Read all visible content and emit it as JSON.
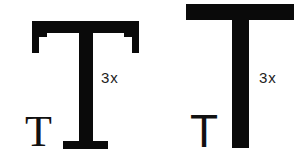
{
  "diagram": {
    "title": "",
    "panels": [
      {
        "name": "serif",
        "small_letter": "T",
        "scale_label": "3x",
        "description": "Small serif T next to a 3x enlarged serif T"
      },
      {
        "name": "sans-serif",
        "small_letter": "T",
        "scale_label": "3x",
        "description": "Small sans-serif T next to a 3x enlarged sans-serif T"
      }
    ],
    "colors": {
      "background": "#ffffff",
      "glyph": "#0a0a0a",
      "label": "#222222"
    }
  }
}
